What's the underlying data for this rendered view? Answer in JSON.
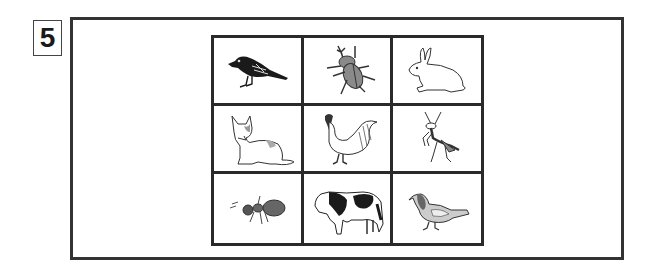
{
  "question": {
    "number": "5"
  },
  "grid": {
    "rows": 3,
    "columns": 3,
    "cells": [
      {
        "row": 1,
        "col": 1,
        "animal": "crow",
        "icon": "crow-icon"
      },
      {
        "row": 1,
        "col": 2,
        "animal": "rhinoceros beetle",
        "icon": "beetle-icon"
      },
      {
        "row": 1,
        "col": 3,
        "animal": "rabbit",
        "icon": "rabbit-icon"
      },
      {
        "row": 2,
        "col": 1,
        "animal": "cat",
        "icon": "cat-icon"
      },
      {
        "row": 2,
        "col": 2,
        "animal": "rooster",
        "icon": "rooster-icon"
      },
      {
        "row": 2,
        "col": 3,
        "animal": "praying mantis",
        "icon": "mantis-icon"
      },
      {
        "row": 3,
        "col": 1,
        "animal": "ant",
        "icon": "ant-icon"
      },
      {
        "row": 3,
        "col": 2,
        "animal": "cow",
        "icon": "cow-icon"
      },
      {
        "row": 3,
        "col": 3,
        "animal": "pigeon",
        "icon": "pigeon-icon"
      }
    ]
  },
  "colors": {
    "line": "#2a2a2a",
    "background": "#ffffff",
    "gray_fill": "#8a8a8a",
    "dark_fill": "#1a1a1a"
  }
}
